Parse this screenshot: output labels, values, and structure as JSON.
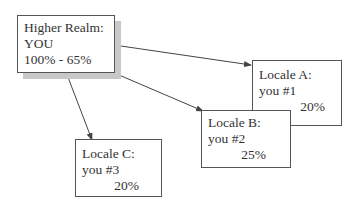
{
  "diagram": {
    "root": {
      "title": "Higher Realm:",
      "subtitle": "YOU",
      "range": "100% - 65%"
    },
    "nodes": [
      {
        "title": "Locale A:",
        "label": "you #1",
        "value": "20%"
      },
      {
        "title": "Locale B:",
        "label": "you #2",
        "value": "25%"
      },
      {
        "title": "Locale C:",
        "label": "you #3",
        "value": "20%"
      }
    ],
    "edges": [
      {
        "from": "Higher Realm",
        "to": "Locale A"
      },
      {
        "from": "Higher Realm",
        "to": "Locale B"
      },
      {
        "from": "Higher Realm",
        "to": "Locale C"
      }
    ],
    "colors": {
      "line": "#444444",
      "shadow": "#c8c8c8",
      "border": "#555555"
    }
  }
}
